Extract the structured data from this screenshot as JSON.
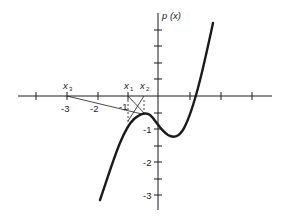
{
  "figure": {
    "y_axis_label": "p (x)",
    "x_tick_labels": [
      "-3",
      "-2",
      "-1"
    ],
    "y_tick_labels": [
      "-1",
      "-2",
      "-3"
    ],
    "iterate_labels": {
      "x1": "x",
      "x1_sub": "1",
      "x2": "x",
      "x2_sub": "2",
      "x3": "x",
      "x3_sub": "3"
    },
    "colors": {
      "ink": "#1a1a1a",
      "background": "#ffffff"
    }
  }
}
